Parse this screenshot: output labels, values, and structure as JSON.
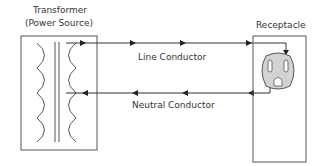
{
  "diagram": {
    "transformer": {
      "title_line1": "Transformer",
      "title_line2": "(Power Source)"
    },
    "receptacle": {
      "title": "Receptacle"
    },
    "conductors": [
      {
        "name": "line",
        "label": "Line Conductor",
        "direction": "to-receptacle"
      },
      {
        "name": "neutral",
        "label": "Neutral Conductor",
        "direction": "to-transformer"
      }
    ],
    "colors": {
      "stroke": "#333333",
      "receptacle_fill": "#d3d3d3",
      "background": "#ffffff"
    }
  }
}
